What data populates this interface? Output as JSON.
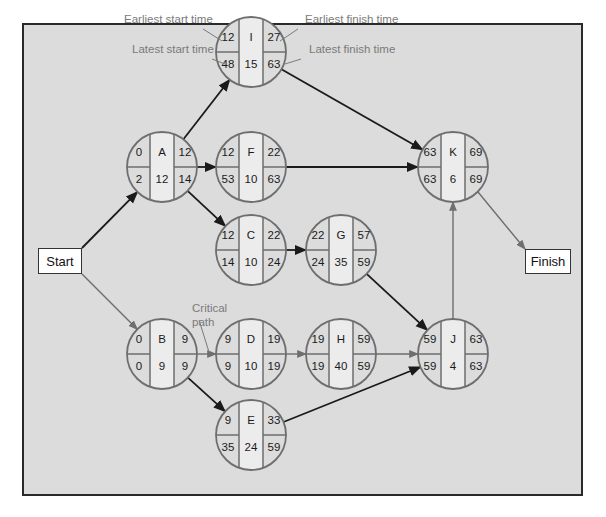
{
  "diagram": {
    "type": "critical-path-network",
    "start_label": "Start",
    "finish_label": "Finish",
    "annotations": {
      "earliest_start": "Earliest start time",
      "earliest_finish": "Earliest finish time",
      "latest_start": "Latest start time",
      "latest_finish": "Latest finish time",
      "critical_path": "Critical path"
    },
    "colors": {
      "background": "#dcdcdc",
      "frame": "#2a2a2a",
      "node_fill": "#dcdcdc",
      "node_center_fill": "#ececec",
      "node_stroke": "#6e6e6e",
      "arrow_normal": "#1a1a1a",
      "arrow_critical": "#6e6e6e",
      "annotation_text": "#7a7a7a"
    },
    "nodes": [
      {
        "id": "I",
        "es": "12",
        "ef": "27",
        "ls": "48",
        "lf": "63",
        "dur": "15"
      },
      {
        "id": "A",
        "es": "0",
        "ef": "12",
        "ls": "2",
        "lf": "14",
        "dur": "12"
      },
      {
        "id": "F",
        "es": "12",
        "ef": "22",
        "ls": "53",
        "lf": "63",
        "dur": "10"
      },
      {
        "id": "K",
        "es": "63",
        "ef": "69",
        "ls": "63",
        "lf": "69",
        "dur": "6"
      },
      {
        "id": "C",
        "es": "12",
        "ef": "22",
        "ls": "14",
        "lf": "24",
        "dur": "10"
      },
      {
        "id": "G",
        "es": "22",
        "ef": "57",
        "ls": "24",
        "lf": "59",
        "dur": "35"
      },
      {
        "id": "B",
        "es": "0",
        "ef": "9",
        "ls": "0",
        "lf": "9",
        "dur": "9"
      },
      {
        "id": "D",
        "es": "9",
        "ef": "19",
        "ls": "9",
        "lf": "19",
        "dur": "10"
      },
      {
        "id": "H",
        "es": "19",
        "ef": "59",
        "ls": "19",
        "lf": "59",
        "dur": "40"
      },
      {
        "id": "J",
        "es": "59",
        "ef": "63",
        "ls": "59",
        "lf": "63",
        "dur": "4"
      },
      {
        "id": "E",
        "es": "9",
        "ef": "33",
        "ls": "35",
        "lf": "59",
        "dur": "24"
      }
    ],
    "edges": [
      {
        "from": "Start",
        "to": "A",
        "critical": false
      },
      {
        "from": "Start",
        "to": "B",
        "critical": true
      },
      {
        "from": "A",
        "to": "I",
        "critical": false
      },
      {
        "from": "A",
        "to": "F",
        "critical": false
      },
      {
        "from": "A",
        "to": "C",
        "critical": false
      },
      {
        "from": "I",
        "to": "K",
        "critical": false
      },
      {
        "from": "F",
        "to": "K",
        "critical": false
      },
      {
        "from": "C",
        "to": "G",
        "critical": false
      },
      {
        "from": "G",
        "to": "J",
        "critical": false
      },
      {
        "from": "B",
        "to": "D",
        "critical": true
      },
      {
        "from": "B",
        "to": "E",
        "critical": false
      },
      {
        "from": "D",
        "to": "H",
        "critical": true
      },
      {
        "from": "H",
        "to": "J",
        "critical": true
      },
      {
        "from": "E",
        "to": "J",
        "critical": false
      },
      {
        "from": "J",
        "to": "K",
        "critical": true
      },
      {
        "from": "K",
        "to": "Finish",
        "critical": true
      }
    ]
  }
}
